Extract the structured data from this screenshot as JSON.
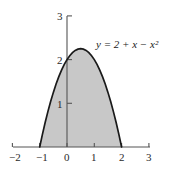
{
  "figure": {
    "name": "shaded-area-under-parabola",
    "background_color": "#ffffff",
    "axis_color": "#555555",
    "curve_color": "#1a1a1a",
    "fill_color": "#c8c8c8",
    "equation_label": "y = 2 + x − x²"
  },
  "axes": {
    "x_tick_labels": [
      "−2",
      "−1",
      "0",
      "1",
      "2",
      "3"
    ],
    "y_tick_labels": [
      "1",
      "2",
      "3"
    ]
  },
  "chart_data": {
    "type": "area",
    "title": "",
    "xlabel": "",
    "ylabel": "",
    "equation": "y = 2 + x - x^2",
    "curve_label": "y = 2 + x − x²",
    "xlim": [
      -2,
      3
    ],
    "ylim": [
      0,
      3
    ],
    "xticks": [
      -2,
      -1,
      0,
      1,
      2,
      3
    ],
    "yticks": [
      1,
      2,
      3
    ],
    "grid": false,
    "legend": "none",
    "shaded_region": {
      "from_x": -1,
      "to_x": 2,
      "baseline_y": 0,
      "fill": "#c8c8c8",
      "description": "region between curve and x-axis from x=-1 to x=2"
    },
    "roots": [
      -1,
      2
    ],
    "vertex": [
      0.5,
      2.25
    ],
    "y_intercept": 2,
    "x": [
      -1.0,
      -0.9,
      -0.8,
      -0.7,
      -0.6,
      -0.5,
      -0.4,
      -0.3,
      -0.2,
      -0.1,
      0.0,
      0.1,
      0.2,
      0.3,
      0.4,
      0.5,
      0.6,
      0.7,
      0.8,
      0.9,
      1.0,
      1.1,
      1.2,
      1.3,
      1.4,
      1.5,
      1.6,
      1.7,
      1.8,
      1.9,
      2.0
    ],
    "y": [
      0.0,
      0.29,
      0.56,
      0.81,
      1.04,
      1.25,
      1.44,
      1.61,
      1.76,
      1.89,
      2.0,
      2.09,
      2.16,
      2.21,
      2.24,
      2.25,
      2.24,
      2.21,
      2.16,
      2.09,
      2.0,
      1.89,
      1.76,
      1.61,
      1.44,
      1.25,
      1.04,
      0.81,
      0.56,
      0.29,
      0.0
    ]
  }
}
